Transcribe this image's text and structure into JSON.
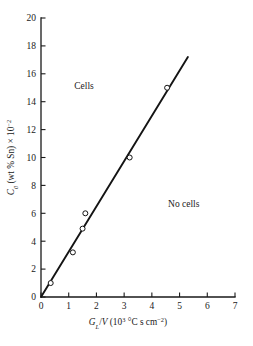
{
  "chart_data": {
    "type": "scatter",
    "title": "",
    "subtitle": "",
    "xlabel_parts": {
      "symbol": "G",
      "symbol_sub": "L",
      "divider": "/",
      "symbol2": "V",
      "units_open": " (10",
      "units_exp": "3",
      "units_rest": " °C s cm",
      "units_exp2": "−2",
      "units_close": ")"
    },
    "xlabel": "GL/V (10³ °C s cm⁻²)",
    "ylabel_parts": {
      "symbol": "C",
      "symbol_sub": "0",
      "rest": " (wt % Sn) × 10",
      "exp": "−2"
    },
    "ylabel": "C₀ (wt % Sn) × 10⁻²",
    "xlim": [
      0,
      7
    ],
    "ylim": [
      0,
      20
    ],
    "xticks": [
      0,
      1,
      2,
      3,
      4,
      5,
      6,
      7
    ],
    "yticks": [
      0,
      2,
      4,
      6,
      8,
      10,
      12,
      14,
      16,
      18,
      20
    ],
    "xtick_labels": [
      "0",
      "1",
      "2",
      "3",
      "4",
      "5",
      "6",
      "7"
    ],
    "ytick_labels": [
      "0",
      "2",
      "4",
      "6",
      "8",
      "10",
      "12",
      "14",
      "16",
      "18",
      "20"
    ],
    "grid": false,
    "legend": false,
    "marker": "open-circle",
    "points": [
      {
        "x": 0.35,
        "y": 1.0
      },
      {
        "x": 1.15,
        "y": 3.2
      },
      {
        "x": 1.5,
        "y": 4.9
      },
      {
        "x": 1.6,
        "y": 6.0
      },
      {
        "x": 3.2,
        "y": 10.0
      },
      {
        "x": 4.55,
        "y": 15.0
      }
    ],
    "fit_line": {
      "x0": 0.0,
      "y0": 0.0,
      "x1": 5.3,
      "y1": 17.2,
      "slope": 3.245,
      "intercept": 0
    },
    "annotations": [
      {
        "id": "cells",
        "text": "Cells",
        "x": 1.55,
        "y": 14.9
      },
      {
        "id": "no-cells",
        "text": "No cells",
        "x": 5.15,
        "y": 6.45
      }
    ]
  },
  "geometry": {
    "plot_left": 41,
    "plot_right": 235,
    "plot_bottom": 297,
    "plot_top": 18,
    "tick_len_x": 4.5,
    "tick_len_y": 4.5
  }
}
